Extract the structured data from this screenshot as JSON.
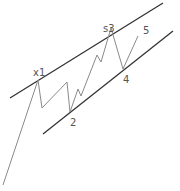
{
  "diagram": {
    "colors": {
      "channel": "#333333",
      "wave": "#8a8a8a",
      "label": "#555555"
    },
    "labels": [
      {
        "id": "x1",
        "text": "x1",
        "x": 33,
        "y": 68
      },
      {
        "id": "2",
        "text": "2",
        "x": 70,
        "y": 118
      },
      {
        "id": "s3",
        "text": "s3",
        "x": 103,
        "y": 24
      },
      {
        "id": "4",
        "text": "4",
        "x": 123,
        "y": 75
      },
      {
        "id": "5",
        "text": "5",
        "x": 143,
        "y": 26
      }
    ]
  }
}
